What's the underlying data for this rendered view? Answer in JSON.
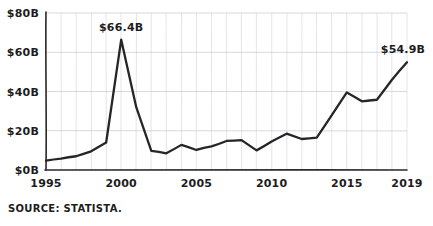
{
  "chart_data": {
    "type": "line",
    "title": "",
    "subtitle": "",
    "xlabel": "",
    "ylabel": "",
    "xlim": [
      1995,
      2019
    ],
    "ylim": [
      0,
      80
    ],
    "grid": "both",
    "legend": "none",
    "y_unit": "billion USD",
    "y_ticks": [
      0,
      20,
      40,
      60,
      80
    ],
    "y_tick_labels": [
      "$0B",
      "$20B",
      "$40B",
      "$60B",
      "$80B"
    ],
    "x_ticks": [
      1995,
      2000,
      2005,
      2010,
      2015,
      2019
    ],
    "x_tick_labels": [
      "1995",
      "2000",
      "2005",
      "2010",
      "2015",
      "2019"
    ],
    "x": [
      1995,
      1996,
      1997,
      1998,
      1999,
      2000,
      2001,
      2002,
      2003,
      2004,
      2005,
      2006,
      2007,
      2008,
      2009,
      2010,
      2011,
      2012,
      2013,
      2014,
      2015,
      2016,
      2017,
      2018,
      2019
    ],
    "values": [
      4.8,
      5.8,
      7.0,
      9.5,
      14.0,
      66.4,
      32.0,
      9.8,
      8.5,
      12.8,
      10.2,
      12.0,
      14.8,
      15.2,
      10.0,
      14.5,
      18.5,
      15.8,
      16.5,
      28.0,
      39.5,
      35.0,
      35.8,
      46.0,
      54.9
    ],
    "annotations": [
      {
        "name": "peak-label",
        "label": "$66.4B",
        "x": 2000,
        "y": 66.4
      },
      {
        "name": "last-value-label",
        "label": "$54.9B",
        "x": 2019,
        "y": 54.9
      }
    ]
  },
  "source": {
    "text": "SOURCE: STATISTA."
  },
  "colors": {
    "line": "#262626",
    "grid": "#cfd3da",
    "axis": "#2b2b2b",
    "text": "#1d1d1d",
    "background": "#ffffff"
  }
}
